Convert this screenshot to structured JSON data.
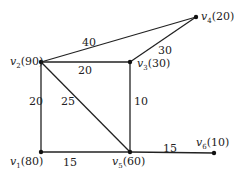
{
  "graph": {
    "nodes": [
      {
        "id": "v1",
        "label": "v",
        "sub": "1",
        "value": "(80)",
        "x": 41,
        "y": 152
      },
      {
        "id": "v2",
        "label": "v",
        "sub": "2",
        "value": "(90)",
        "x": 41,
        "y": 62
      },
      {
        "id": "v3",
        "label": "v",
        "sub": "3",
        "value": "(30)",
        "x": 130,
        "y": 62
      },
      {
        "id": "v4",
        "label": "v",
        "sub": "4",
        "value": "(20)",
        "x": 196,
        "y": 17
      },
      {
        "id": "v5",
        "label": "v",
        "sub": "5",
        "value": "(60)",
        "x": 130,
        "y": 152
      },
      {
        "id": "v6",
        "label": "v",
        "sub": "6",
        "value": "(10)",
        "x": 214,
        "y": 153
      }
    ],
    "edges": [
      {
        "from": "v2",
        "to": "v4",
        "weight": "40"
      },
      {
        "from": "v2",
        "to": "v3",
        "weight": "20"
      },
      {
        "from": "v3",
        "to": "v4",
        "weight": "30"
      },
      {
        "from": "v2",
        "to": "v1",
        "weight": "20"
      },
      {
        "from": "v2",
        "to": "v5",
        "weight": "25"
      },
      {
        "from": "v3",
        "to": "v5",
        "weight": "10"
      },
      {
        "from": "v1",
        "to": "v5",
        "weight": "15"
      },
      {
        "from": "v5",
        "to": "v6",
        "weight": "15"
      }
    ]
  }
}
